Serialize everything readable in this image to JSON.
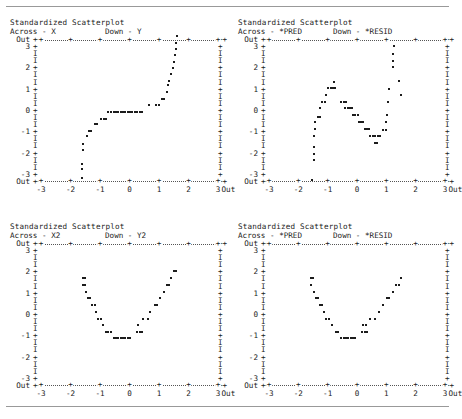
{
  "document": {
    "rules": {
      "top": true,
      "bottom": true
    }
  },
  "axis": {
    "y_labels": [
      "Out",
      "3",
      "",
      "",
      "2",
      "",
      "",
      "1",
      "",
      "",
      "0",
      "",
      "",
      "-1",
      "",
      "",
      "-2",
      "",
      "",
      "-3",
      "Out"
    ],
    "y_ticks": [
      "++",
      "+",
      "I",
      "I",
      "+",
      "I",
      "I",
      "+",
      "I",
      "I",
      "+",
      "I",
      "I",
      "+",
      "I",
      "I",
      "+",
      "I",
      "I",
      "+",
      "++"
    ],
    "y_right": [
      "++",
      "+",
      "I",
      "I",
      "+",
      "I",
      "I",
      "+",
      "I",
      "I",
      "+",
      "I",
      "I",
      "+",
      "I",
      "I",
      "+",
      "I",
      "I",
      "+",
      "++"
    ],
    "x_labels": [
      "-3",
      "-2",
      "-1",
      "0",
      "1",
      "2",
      "3"
    ],
    "x_out_label": "Out",
    "x_tick_glyph": "+",
    "out_label": "Out",
    "range": [
      -3,
      3
    ],
    "dot_glyph": "*"
  },
  "panels": [
    {
      "title": "Standardized Scatterplot",
      "across_label": "Across - X",
      "down_label": "Down - Y",
      "across_var": "X",
      "down_var": "Y",
      "chart_data": {
        "type": "scatter",
        "title": "Standardized Scatterplot",
        "xlabel": "X",
        "ylabel": "Y",
        "xlim": [
          -3,
          3
        ],
        "ylim": [
          -3,
          3
        ],
        "grid": false,
        "legend": "none",
        "shape": "monotonic S-curve / sigmoid",
        "points": [
          [
            -1.62,
            -3.0
          ],
          [
            -1.62,
            -2.62
          ],
          [
            -1.62,
            -2.4
          ],
          [
            -1.58,
            -1.78
          ],
          [
            -1.56,
            -1.48
          ],
          [
            -1.44,
            -1.12
          ],
          [
            -1.38,
            -0.92
          ],
          [
            -1.3,
            -0.9
          ],
          [
            -1.18,
            -0.62
          ],
          [
            -1.1,
            -0.62
          ],
          [
            -0.96,
            -0.38
          ],
          [
            -0.88,
            -0.38
          ],
          [
            -0.8,
            -0.38
          ],
          [
            -0.72,
            -0.06
          ],
          [
            -0.62,
            -0.06
          ],
          [
            -0.54,
            -0.06
          ],
          [
            -0.46,
            -0.06
          ],
          [
            -0.38,
            -0.06
          ],
          [
            -0.3,
            -0.06
          ],
          [
            -0.22,
            -0.06
          ],
          [
            -0.14,
            -0.06
          ],
          [
            -0.06,
            -0.06
          ],
          [
            0.02,
            -0.06
          ],
          [
            0.1,
            -0.06
          ],
          [
            0.18,
            -0.06
          ],
          [
            0.26,
            -0.06
          ],
          [
            0.34,
            -0.06
          ],
          [
            0.42,
            -0.06
          ],
          [
            0.66,
            0.24
          ],
          [
            0.9,
            0.24
          ],
          [
            1.0,
            0.24
          ],
          [
            1.1,
            0.52
          ],
          [
            1.18,
            0.52
          ],
          [
            1.26,
            0.84
          ],
          [
            1.3,
            1.12
          ],
          [
            1.34,
            1.32
          ],
          [
            1.42,
            1.62
          ],
          [
            1.46,
            1.9
          ],
          [
            1.5,
            2.14
          ],
          [
            1.54,
            2.48
          ],
          [
            1.58,
            2.74
          ],
          [
            1.58,
            3.0
          ],
          [
            1.6,
            3.3
          ]
        ]
      }
    },
    {
      "title": "Standardized Scatterplot",
      "across_label": "Across - *PRED",
      "down_label": "Down - *RESID",
      "across_var": "*PRED",
      "down_var": "*RESID",
      "chart_data": {
        "type": "scatter",
        "title": "Standardized Scatterplot",
        "xlabel": "*PRED",
        "ylabel": "*RESID",
        "xlim": [
          -3,
          3
        ],
        "ylim": [
          -3,
          3
        ],
        "grid": false,
        "legend": "none",
        "shape": "curved residual pattern, inverted-U then rise",
        "points": [
          [
            -1.52,
            -3.08
          ],
          [
            -1.48,
            -2.22
          ],
          [
            -1.48,
            -1.92
          ],
          [
            -1.48,
            -1.62
          ],
          [
            -1.46,
            -1.12
          ],
          [
            -1.44,
            -0.84
          ],
          [
            -1.42,
            -0.52
          ],
          [
            -1.34,
            -0.28
          ],
          [
            -1.26,
            -0.28
          ],
          [
            -1.26,
            0.1
          ],
          [
            -1.18,
            0.38
          ],
          [
            -1.1,
            0.38
          ],
          [
            -1.06,
            0.68
          ],
          [
            -0.98,
            0.98
          ],
          [
            -0.9,
            0.98
          ],
          [
            -0.82,
            0.98
          ],
          [
            -0.74,
            0.98
          ],
          [
            -0.78,
            1.26
          ],
          [
            -0.56,
            0.38
          ],
          [
            -0.46,
            0.38
          ],
          [
            -0.38,
            0.38
          ],
          [
            -0.4,
            0.1
          ],
          [
            -0.32,
            0.1
          ],
          [
            -0.24,
            0.1
          ],
          [
            -0.16,
            0.1
          ],
          [
            -0.14,
            -0.22
          ],
          [
            -0.06,
            -0.22
          ],
          [
            0.02,
            -0.22
          ],
          [
            0.06,
            -0.52
          ],
          [
            0.14,
            -0.52
          ],
          [
            0.22,
            -0.52
          ],
          [
            0.26,
            -0.84
          ],
          [
            0.34,
            -0.84
          ],
          [
            0.42,
            -0.84
          ],
          [
            0.46,
            -1.14
          ],
          [
            0.54,
            -1.14
          ],
          [
            0.62,
            -1.14
          ],
          [
            0.7,
            -1.14
          ],
          [
            0.78,
            -1.14
          ],
          [
            0.6,
            -1.44
          ],
          [
            0.68,
            -1.44
          ],
          [
            0.9,
            -0.86
          ],
          [
            0.98,
            -0.86
          ],
          [
            1.0,
            -0.52
          ],
          [
            1.02,
            -0.22
          ],
          [
            1.06,
            0.38
          ],
          [
            1.1,
            0.96
          ],
          [
            1.22,
            1.92
          ],
          [
            1.24,
            2.22
          ],
          [
            1.24,
            2.52
          ],
          [
            1.26,
            2.88
          ],
          [
            1.44,
            1.3
          ],
          [
            1.5,
            0.7
          ]
        ]
      }
    },
    {
      "title": "Standardized Scatterplot",
      "across_label": "Across - X2",
      "down_label": "Down - Y2",
      "across_var": "X2",
      "down_var": "Y2",
      "chart_data": {
        "type": "scatter",
        "title": "Standardized Scatterplot",
        "xlabel": "X2",
        "ylabel": "Y2",
        "xlim": [
          -3,
          3
        ],
        "ylim": [
          -3,
          3
        ],
        "grid": false,
        "legend": "none",
        "shape": "U-shaped / quadratic",
        "points": [
          [
            -1.58,
            1.62
          ],
          [
            -1.5,
            1.62
          ],
          [
            -1.58,
            1.32
          ],
          [
            -1.5,
            1.32
          ],
          [
            -1.48,
            1.02
          ],
          [
            -1.42,
            0.72
          ],
          [
            -1.34,
            0.72
          ],
          [
            -1.26,
            0.42
          ],
          [
            -1.18,
            0.42
          ],
          [
            -1.14,
            0.12
          ],
          [
            -1.06,
            -0.18
          ],
          [
            -0.98,
            -0.18
          ],
          [
            -0.9,
            -0.48
          ],
          [
            -0.8,
            -0.78
          ],
          [
            -0.72,
            -0.78
          ],
          [
            -0.64,
            -0.78
          ],
          [
            -0.54,
            -1.06
          ],
          [
            -0.46,
            -1.06
          ],
          [
            -0.38,
            -1.06
          ],
          [
            -0.3,
            -1.06
          ],
          [
            -0.22,
            -1.06
          ],
          [
            -0.14,
            -1.06
          ],
          [
            -0.06,
            -1.06
          ],
          [
            0.02,
            -1.06
          ],
          [
            0.26,
            -0.78
          ],
          [
            0.34,
            -0.78
          ],
          [
            0.42,
            -0.78
          ],
          [
            0.3,
            -0.48
          ],
          [
            0.46,
            -0.18
          ],
          [
            0.62,
            -0.18
          ],
          [
            0.7,
            0.12
          ],
          [
            0.86,
            0.42
          ],
          [
            0.94,
            0.42
          ],
          [
            1.02,
            0.72
          ],
          [
            1.18,
            1.02
          ],
          [
            1.26,
            1.32
          ],
          [
            1.34,
            1.32
          ],
          [
            1.42,
            1.62
          ],
          [
            1.5,
            1.92
          ],
          [
            1.58,
            1.92
          ]
        ]
      }
    },
    {
      "title": "Standardized Scatterplot",
      "across_label": "Across - *PRED",
      "down_label": "Down - *RESID",
      "across_var": "*PRED",
      "down_var": "*RESID",
      "chart_data": {
        "type": "scatter",
        "title": "Standardized Scatterplot",
        "xlabel": "*PRED",
        "ylabel": "*RESID",
        "xlim": [
          -3,
          3
        ],
        "ylim": [
          -3,
          3
        ],
        "grid": false,
        "legend": "none",
        "shape": "U-shaped / quadratic residual pattern",
        "points": [
          [
            -1.58,
            1.62
          ],
          [
            -1.5,
            1.62
          ],
          [
            -1.56,
            1.32
          ],
          [
            -1.46,
            1.02
          ],
          [
            -1.4,
            0.72
          ],
          [
            -1.32,
            0.72
          ],
          [
            -1.26,
            0.42
          ],
          [
            -1.18,
            0.42
          ],
          [
            -1.12,
            0.12
          ],
          [
            -1.04,
            -0.18
          ],
          [
            -0.96,
            -0.18
          ],
          [
            -0.86,
            -0.48
          ],
          [
            -0.72,
            -0.78
          ],
          [
            -0.64,
            -0.78
          ],
          [
            -0.54,
            -1.06
          ],
          [
            -0.46,
            -1.06
          ],
          [
            -0.38,
            -1.06
          ],
          [
            -0.3,
            -1.06
          ],
          [
            -0.22,
            -1.06
          ],
          [
            -0.14,
            -1.06
          ],
          [
            -0.06,
            -1.06
          ],
          [
            0.18,
            -0.78
          ],
          [
            0.26,
            -0.78
          ],
          [
            0.34,
            -0.78
          ],
          [
            0.22,
            -0.48
          ],
          [
            0.3,
            -0.48
          ],
          [
            0.46,
            -0.18
          ],
          [
            0.62,
            -0.18
          ],
          [
            0.74,
            0.12
          ],
          [
            0.9,
            0.42
          ],
          [
            1.02,
            0.72
          ],
          [
            1.1,
            0.72
          ],
          [
            1.22,
            1.02
          ],
          [
            1.34,
            1.32
          ],
          [
            1.42,
            1.32
          ],
          [
            1.5,
            1.62
          ]
        ]
      }
    }
  ]
}
